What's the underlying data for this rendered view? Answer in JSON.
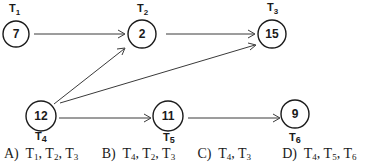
{
  "diagram": {
    "nodes": [
      {
        "id": "T1",
        "label": "T",
        "sub": "1",
        "value": "7",
        "cx": 16,
        "cy": 34,
        "r": 13
      },
      {
        "id": "T2",
        "label": "T",
        "sub": "2",
        "value": "2",
        "cx": 142,
        "cy": 34,
        "r": 15
      },
      {
        "id": "T3",
        "label": "T",
        "sub": "3",
        "value": "15",
        "cx": 272,
        "cy": 34,
        "r": 15
      },
      {
        "id": "T4",
        "label": "T",
        "sub": "4",
        "value": "12",
        "cx": 41,
        "cy": 114,
        "r": 15
      },
      {
        "id": "T5",
        "label": "T",
        "sub": "5",
        "value": "11",
        "cx": 168,
        "cy": 114,
        "r": 15
      },
      {
        "id": "T6",
        "label": "T",
        "sub": "6",
        "value": "9",
        "cx": 295,
        "cy": 114,
        "r": 14
      }
    ],
    "edges": [
      {
        "from": "T1",
        "to": "T2"
      },
      {
        "from": "T2",
        "to": "T3"
      },
      {
        "from": "T4",
        "to": "T2"
      },
      {
        "from": "T4",
        "to": "T3"
      },
      {
        "from": "T4",
        "to": "T5"
      },
      {
        "from": "T5",
        "to": "T6"
      }
    ]
  },
  "options": [
    {
      "letter": "A)",
      "items": [
        {
          "t": "T",
          "s": "1"
        },
        {
          "t": "T",
          "s": "2"
        },
        {
          "t": "T",
          "s": "3"
        }
      ]
    },
    {
      "letter": "B)",
      "items": [
        {
          "t": "T",
          "s": "4"
        },
        {
          "t": "T",
          "s": "2"
        },
        {
          "t": "T",
          "s": "3"
        }
      ]
    },
    {
      "letter": "C)",
      "items": [
        {
          "t": "T",
          "s": "4"
        },
        {
          "t": "T",
          "s": "3"
        }
      ]
    },
    {
      "letter": "D)",
      "items": [
        {
          "t": "T",
          "s": "4"
        },
        {
          "t": "T",
          "s": "5"
        },
        {
          "t": "T",
          "s": "6"
        }
      ]
    }
  ],
  "colors": {
    "ink": "#1a1a1a",
    "edge": "#3a3a3a",
    "background": "#ffffff"
  }
}
